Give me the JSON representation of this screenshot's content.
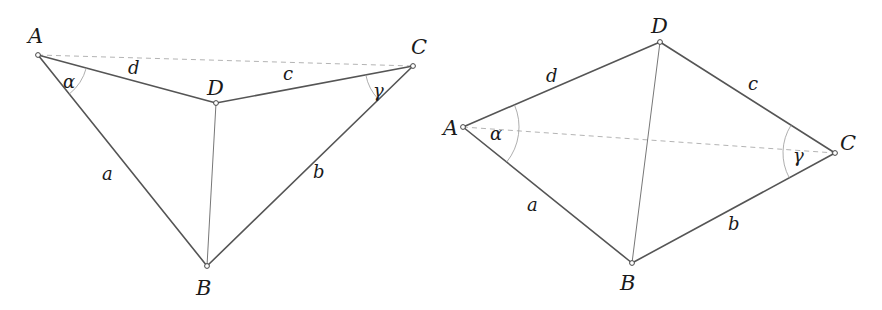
{
  "figures": [
    {
      "name": "concave-quadrilateral",
      "vertices": {
        "A": {
          "x": 38,
          "y": 55,
          "label": "A",
          "lx": 28,
          "ly": 43
        },
        "B": {
          "x": 207,
          "y": 266,
          "label": "B",
          "lx": 196,
          "ly": 295
        },
        "C": {
          "x": 413,
          "y": 66,
          "label": "C",
          "lx": 411,
          "ly": 54
        },
        "D": {
          "x": 216,
          "y": 103,
          "label": "D",
          "lx": 207,
          "ly": 95
        }
      },
      "sides": [
        {
          "from": "A",
          "to": "D",
          "label": "d",
          "lx": 128,
          "ly": 74
        },
        {
          "from": "D",
          "to": "C",
          "label": "c",
          "lx": 283,
          "ly": 80
        },
        {
          "from": "A",
          "to": "B",
          "label": "a",
          "lx": 102,
          "ly": 180
        },
        {
          "from": "C",
          "to": "B",
          "label": "b",
          "lx": 313,
          "ly": 178
        }
      ],
      "diagonal": {
        "from": "D",
        "to": "B"
      },
      "dashed": {
        "from": "A",
        "to": "C"
      },
      "angles": [
        {
          "at": "A",
          "p1": "D",
          "p2": "B",
          "r": 50,
          "label": "α",
          "lx": 63,
          "ly": 88
        },
        {
          "at": "C",
          "p1": "D",
          "p2": "B",
          "r": 48,
          "label": "γ",
          "lx": 373,
          "ly": 97
        }
      ]
    },
    {
      "name": "convex-quadrilateral",
      "vertices": {
        "A": {
          "x": 463,
          "y": 127,
          "label": "A",
          "lx": 443,
          "ly": 135
        },
        "B": {
          "x": 632,
          "y": 263,
          "label": "B",
          "lx": 620,
          "ly": 290
        },
        "C": {
          "x": 835,
          "y": 153,
          "label": "C",
          "lx": 840,
          "ly": 150
        },
        "D": {
          "x": 660,
          "y": 42,
          "label": "D",
          "lx": 651,
          "ly": 33
        }
      },
      "sides": [
        {
          "from": "A",
          "to": "D",
          "label": "d",
          "lx": 546,
          "ly": 82
        },
        {
          "from": "D",
          "to": "C",
          "label": "c",
          "lx": 748,
          "ly": 90
        },
        {
          "from": "A",
          "to": "B",
          "label": "a",
          "lx": 527,
          "ly": 211
        },
        {
          "from": "C",
          "to": "B",
          "label": "b",
          "lx": 728,
          "ly": 230
        }
      ],
      "diagonal": {
        "from": "D",
        "to": "B"
      },
      "dashed": {
        "from": "A",
        "to": "C"
      },
      "angles": [
        {
          "at": "A",
          "p1": "D",
          "p2": "B",
          "r": 56,
          "label": "α",
          "lx": 490,
          "ly": 140
        },
        {
          "at": "C",
          "p1": "D",
          "p2": "B",
          "r": 52,
          "label": "γ",
          "lx": 793,
          "ly": 162
        }
      ]
    }
  ]
}
